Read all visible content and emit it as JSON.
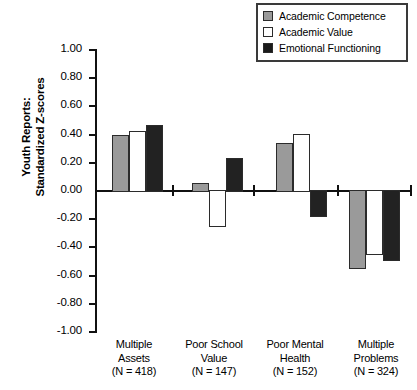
{
  "chart_data": {
    "type": "bar",
    "title": "",
    "subtitle": "",
    "xlabel": "",
    "ylabel": "Youth Reports: Standardized Z-scores",
    "ylabel_line1": "Youth Reports:",
    "ylabel_line2": "Standardized Z-scores",
    "ylim": [
      -1.0,
      1.0
    ],
    "ytick_values": [
      1.0,
      0.8,
      0.6,
      0.4,
      0.2,
      0.0,
      -0.2,
      -0.4,
      -0.6,
      -0.8,
      -1.0
    ],
    "ytick_labels": [
      "1.00",
      "0.80",
      "0.60",
      "0.40",
      "0.20",
      "0.00",
      "-0.20",
      "-0.40",
      "-0.60",
      "-0.80",
      "-1.00"
    ],
    "grid": false,
    "legend_position": "top-right",
    "categories": [
      "Multiple Assets",
      "Poor School Value",
      "Poor Mental Health",
      "Multiple Problems"
    ],
    "category_labels": [
      {
        "line1": "Multiple",
        "line2": "Assets",
        "line3": "(N = 418)"
      },
      {
        "line1": "Poor School",
        "line2": "Value",
        "line3": "(N = 147)"
      },
      {
        "line1": "Poor Mental",
        "line2": "Health",
        "line3": "(N = 152)"
      },
      {
        "line1": "Multiple",
        "line2": "Problems",
        "line3": "(N = 324)"
      }
    ],
    "group_sizes": [
      418,
      147,
      152,
      324
    ],
    "series": [
      {
        "name": "Academic Competence",
        "color": "#9a9a9a",
        "values": [
          0.39,
          0.05,
          0.33,
          -0.545
        ]
      },
      {
        "name": "Academic Value",
        "color": "#ffffff",
        "values": [
          0.415,
          -0.25,
          0.4,
          -0.45
        ]
      },
      {
        "name": "Emotional Functioning",
        "color": "#222222",
        "values": [
          0.46,
          0.225,
          -0.18,
          -0.49
        ]
      }
    ]
  },
  "legend": {
    "items": [
      {
        "label": "Academic Competence",
        "swatch": "gray-swatch-icon"
      },
      {
        "label": "Academic Value",
        "swatch": "white-swatch-icon"
      },
      {
        "label": "Emotional Functioning",
        "swatch": "black-swatch-icon"
      }
    ]
  },
  "colors": {
    "series_gray": "#9a9a9a",
    "series_white": "#ffffff",
    "series_black": "#222222",
    "axis": "#111111",
    "background": "#ffffff"
  }
}
